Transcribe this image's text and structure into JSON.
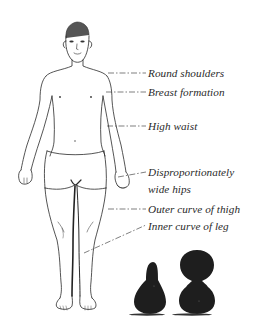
{
  "figure": {
    "colors": {
      "ink": "#2a2a2a",
      "background": "#ffffff",
      "gourd": "#1e1e1e"
    }
  },
  "annotations": [
    {
      "id": "round-shoulders",
      "text": "Round shoulders",
      "x": 148,
      "y": 67
    },
    {
      "id": "breast-formation",
      "text": "Breast formation",
      "x": 148,
      "y": 86
    },
    {
      "id": "high-waist",
      "text": "High waist",
      "x": 148,
      "y": 120
    },
    {
      "id": "hips-line1",
      "text": "Disproportionately",
      "x": 148,
      "y": 166
    },
    {
      "id": "hips-line2",
      "text": "wide hips",
      "x": 148,
      "y": 183
    },
    {
      "id": "outer-thigh",
      "text": "Outer curve of thigh",
      "x": 148,
      "y": 203
    },
    {
      "id": "inner-leg",
      "text": "Inner curve of leg",
      "x": 148,
      "y": 220
    }
  ],
  "shapes": [
    {
      "id": "pear-shape",
      "description": "pear-shaped dark gourd"
    },
    {
      "id": "hourglass-shape",
      "description": "hourglass-shaped dark gourd"
    }
  ]
}
